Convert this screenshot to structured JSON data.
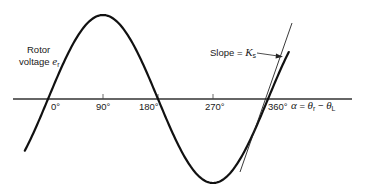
{
  "figure": {
    "y_label": {
      "line1": "Rotor",
      "line2": "voltage",
      "symbol": "e",
      "symbol_sub": "r"
    },
    "slope_label": {
      "text": "Slope = ",
      "symbol": "K",
      "symbol_sub": "s"
    },
    "x_ticks": [
      {
        "label": "0°",
        "deg": 0
      },
      {
        "label": "90°",
        "deg": 90
      },
      {
        "label": "180°",
        "deg": 180
      },
      {
        "label": "270°",
        "deg": 270
      },
      {
        "label": "360°",
        "deg": 360
      }
    ],
    "x_axis_label": {
      "alpha": "α",
      "eq": " = ",
      "theta_r": "θ",
      "theta_r_sub": "r",
      "minus": " − ",
      "theta_l": "θ",
      "theta_l_sub": "L"
    },
    "colors": {
      "curve": "#111111",
      "axis": "#333333",
      "text": "#1a1a1a"
    }
  }
}
